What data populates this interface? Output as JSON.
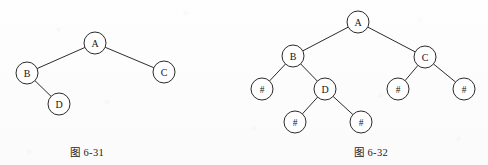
{
  "page": {
    "background_color": "#fdfdfd",
    "ink_color": "#2b2b2b",
    "node_fill": "#ffffff"
  },
  "figures": [
    {
      "id": "6-31",
      "caption": "图 6-31",
      "description": "binary tree",
      "node_radius": 11,
      "nodes": [
        {
          "id": "A",
          "label": "A",
          "x": 95,
          "y": 43
        },
        {
          "id": "B",
          "label": "B",
          "x": 27,
          "y": 73
        },
        {
          "id": "C",
          "label": "C",
          "x": 164,
          "y": 72
        },
        {
          "id": "D",
          "label": "D",
          "x": 59,
          "y": 104
        }
      ],
      "edges": [
        {
          "from": "A",
          "to": "B"
        },
        {
          "from": "A",
          "to": "C"
        },
        {
          "from": "B",
          "to": "D"
        }
      ]
    },
    {
      "id": "6-32",
      "caption": "图 6-32",
      "description": "binary tree with null markers",
      "node_radius": 11,
      "nodes": [
        {
          "id": "A",
          "label": "A",
          "x": 114,
          "y": 22
        },
        {
          "id": "B",
          "label": "B",
          "x": 49,
          "y": 56
        },
        {
          "id": "C",
          "label": "C",
          "x": 181,
          "y": 57
        },
        {
          "id": "N1",
          "label": "#",
          "x": 18,
          "y": 89
        },
        {
          "id": "D",
          "label": "D",
          "x": 81,
          "y": 89
        },
        {
          "id": "N2",
          "label": "#",
          "x": 154,
          "y": 89
        },
        {
          "id": "N3",
          "label": "#",
          "x": 220,
          "y": 89
        },
        {
          "id": "N4",
          "label": "#",
          "x": 51,
          "y": 122
        },
        {
          "id": "N5",
          "label": "#",
          "x": 117,
          "y": 122
        }
      ],
      "edges": [
        {
          "from": "A",
          "to": "B"
        },
        {
          "from": "A",
          "to": "C"
        },
        {
          "from": "B",
          "to": "N1"
        },
        {
          "from": "B",
          "to": "D"
        },
        {
          "from": "C",
          "to": "N2"
        },
        {
          "from": "C",
          "to": "N3"
        },
        {
          "from": "D",
          "to": "N4"
        },
        {
          "from": "D",
          "to": "N5"
        }
      ]
    }
  ]
}
